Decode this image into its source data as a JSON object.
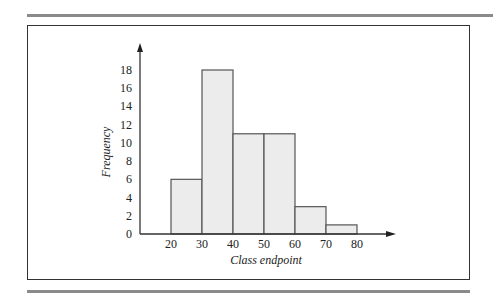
{
  "chart_data": {
    "type": "bar",
    "subtype": "histogram",
    "title": "",
    "xlabel": "Class endpoint",
    "ylabel": "Frequency",
    "bins": [
      [
        20,
        30
      ],
      [
        30,
        40
      ],
      [
        40,
        50
      ],
      [
        50,
        60
      ],
      [
        60,
        70
      ],
      [
        70,
        80
      ]
    ],
    "categories": [
      "20-30",
      "30-40",
      "40-50",
      "50-60",
      "60-70",
      "70-80"
    ],
    "values": [
      6,
      18,
      11,
      11,
      3,
      1
    ],
    "x_ticks": [
      20,
      30,
      40,
      50,
      60,
      70,
      80
    ],
    "y_ticks": [
      0,
      2,
      4,
      6,
      8,
      10,
      12,
      14,
      16,
      18
    ],
    "xlim": [
      10,
      85
    ],
    "ylim": [
      0,
      20
    ],
    "grid": false,
    "legend": null,
    "bar_fill": "#ececec",
    "bar_stroke": "#555555"
  }
}
